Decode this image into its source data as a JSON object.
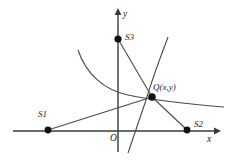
{
  "figure": {
    "type": "geometry-diagram",
    "width": 226,
    "height": 161,
    "background": "#ffffff",
    "stroke_color": "#4a4a4a",
    "axis_color": "#3a3a3a",
    "point_color": "#111111"
  },
  "axes": {
    "x_label": "x",
    "y_label": "y",
    "origin_label": "O",
    "x_axis": {
      "x1": 13,
      "y1": 131,
      "x2": 218,
      "y2": 131
    },
    "y_axis": {
      "x1": 118,
      "y1": 152,
      "x2": 118,
      "y2": 11
    }
  },
  "points": [
    {
      "id": "S1",
      "label": "S1",
      "cx": 48,
      "cy": 130,
      "r": 3.4,
      "label_x": 38,
      "label_y": 114
    },
    {
      "id": "S2",
      "label": "S2",
      "cx": 187,
      "cy": 130,
      "r": 3.4,
      "label_x": 193,
      "label_y": 121
    },
    {
      "id": "S3",
      "label": "S3",
      "cx": 118,
      "cy": 39,
      "r": 3.6,
      "label_x": 125,
      "label_y": 34
    },
    {
      "id": "Q",
      "label": "Q(x,y)",
      "cx": 152,
      "cy": 97,
      "r": 3.8,
      "label_x": 152,
      "label_y": 84
    }
  ],
  "rays": [
    {
      "id": "q-to-s1",
      "from": "Q",
      "to": "S1"
    },
    {
      "id": "q-to-s2",
      "from": "Q",
      "to": "S2"
    },
    {
      "id": "q-to-s3",
      "from": "Q",
      "to": "S3"
    }
  ],
  "curves": [
    {
      "id": "hyperbola-branch-upper-left",
      "description": "branch descending from upper-left through Q and flattening to the right",
      "path": "M 78 50 C 86 74, 104 90, 128 95 C 152 100, 188 104, 224 107"
    },
    {
      "id": "hyperbola-branch-steep",
      "description": "steep branch from top-right of y-axis curving down through Q region to below the x-axis",
      "path": "M 168 37 C 160 58, 152 80, 144 104 C 138 122, 132 140, 128 152"
    }
  ]
}
